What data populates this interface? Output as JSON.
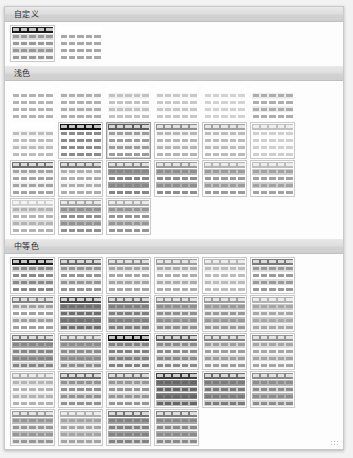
{
  "gallery": {
    "title": "表格样式库",
    "sections": [
      {
        "id": "custom",
        "label": "自定义",
        "columns": 7,
        "thumbs": [
          {
            "name": "custom-style-1",
            "header": "#1c1c1c",
            "band_a": "#d9d9d9",
            "band_b": "#f4f4f4",
            "cell": "#9a9a9a",
            "bordered": true,
            "selected": false
          },
          {
            "name": "custom-style-2",
            "header": "#ffffff",
            "band_a": "#ffffff",
            "band_b": "#ffffff",
            "cell": "#a8a8a8",
            "bordered": false,
            "selected": false
          }
        ]
      },
      {
        "id": "light",
        "label": "浅色",
        "columns": 7,
        "thumbs": [
          {
            "name": "light-1",
            "header": "#ffffff",
            "band_a": "#ffffff",
            "band_b": "#ffffff",
            "cell": "#b4b4b4",
            "bordered": false,
            "selected": false
          },
          {
            "name": "light-2",
            "header": "#ffffff",
            "band_a": "#f6f6f6",
            "band_b": "#ffffff",
            "cell": "#b0b0b0",
            "bordered": false,
            "selected": false
          },
          {
            "name": "light-3",
            "header": "#ffffff",
            "band_a": "#f2f2f2",
            "band_b": "#ffffff",
            "cell": "#c2c2c2",
            "bordered": false,
            "selected": false
          },
          {
            "name": "light-4",
            "header": "#ffffff",
            "band_a": "#f7f7f7",
            "band_b": "#ffffff",
            "cell": "#c8c8c8",
            "bordered": false,
            "selected": false
          },
          {
            "name": "light-5",
            "header": "#ffffff",
            "band_a": "#fafafa",
            "band_b": "#ffffff",
            "cell": "#d2d2d2",
            "bordered": false,
            "selected": false
          },
          {
            "name": "light-6",
            "header": "#ffffff",
            "band_a": "#ededed",
            "band_b": "#ffffff",
            "cell": "#aeaeae",
            "bordered": false,
            "selected": false
          },
          {
            "name": "light-7",
            "header": "#ffffff",
            "band_a": "#f4f4f4",
            "band_b": "#ffffff",
            "cell": "#bdbdbd",
            "bordered": false,
            "selected": false
          },
          {
            "name": "light-8",
            "header": "#141414",
            "band_a": "#ffffff",
            "band_b": "#ffffff",
            "cell": "#8c8c8c",
            "bordered": true,
            "selected": false
          },
          {
            "name": "light-9",
            "header": "#5e5e5e",
            "band_a": "#f0f0f0",
            "band_b": "#ffffff",
            "cell": "#9d9d9d",
            "bordered": true,
            "selected": true
          },
          {
            "name": "light-10",
            "header": "#8f8f8f",
            "band_a": "#f4f4f4",
            "band_b": "#ffffff",
            "cell": "#b6b6b6",
            "bordered": true,
            "selected": false
          },
          {
            "name": "light-11",
            "header": "#a2a2a2",
            "band_a": "#f6f6f6",
            "band_b": "#ffffff",
            "cell": "#bcbcbc",
            "bordered": true,
            "selected": false
          },
          {
            "name": "light-12",
            "header": "#c0c0c0",
            "band_a": "#fafafa",
            "band_b": "#ffffff",
            "cell": "#cfcfcf",
            "bordered": true,
            "selected": false
          },
          {
            "name": "light-13",
            "header": "#6e6e6e",
            "band_a": "#efefef",
            "band_b": "#ffffff",
            "cell": "#a4a4a4",
            "bordered": true,
            "selected": false
          },
          {
            "name": "light-14",
            "header": "#7a7a7a",
            "band_a": "#f2f2f2",
            "band_b": "#ffffff",
            "cell": "#aeaeae",
            "bordered": true,
            "selected": false
          },
          {
            "name": "light-15",
            "header": "#8a8a8a",
            "band_a": "#9e9e9e",
            "band_b": "#ffffff",
            "cell": "#878787",
            "bordered": true,
            "selected": false
          },
          {
            "name": "light-16",
            "header": "#9b9b9b",
            "band_a": "#b2b2b2",
            "band_b": "#ffffff",
            "cell": "#8e8e8e",
            "bordered": true,
            "selected": false
          },
          {
            "name": "light-17",
            "header": "#b4b4b4",
            "band_a": "#c6c6c6",
            "band_b": "#ffffff",
            "cell": "#9c9c9c",
            "bordered": true,
            "selected": false
          },
          {
            "name": "light-18",
            "header": "#bdbdbd",
            "band_a": "#cdcdcd",
            "band_b": "#ffffff",
            "cell": "#a3a3a3",
            "bordered": true,
            "selected": false
          },
          {
            "name": "light-19",
            "header": "#cfcfcf",
            "band_a": "#dcdcdc",
            "band_b": "#ffffff",
            "cell": "#b4b4b4",
            "bordered": true,
            "selected": false
          },
          {
            "name": "light-20",
            "header": "#a5a5a5",
            "band_a": "#b8b8b8",
            "band_b": "#ffffff",
            "cell": "#919191",
            "bordered": true,
            "selected": false
          },
          {
            "name": "light-21",
            "header": "#adadad",
            "band_a": "#c0c0c0",
            "band_b": "#ffffff",
            "cell": "#969696",
            "bordered": true,
            "selected": false
          }
        ]
      },
      {
        "id": "medium",
        "label": "中等色",
        "columns": 7,
        "thumbs": [
          {
            "name": "medium-1",
            "header": "#1a1a1a",
            "band_a": "#d6d6d6",
            "band_b": "#ffffff",
            "cell": "#8a8a8a",
            "bordered": true,
            "selected": false
          },
          {
            "name": "medium-2",
            "header": "#6a6a6a",
            "band_a": "#dcdcdc",
            "band_b": "#ffffff",
            "cell": "#969696",
            "bordered": true,
            "selected": false
          },
          {
            "name": "medium-3",
            "header": "#8d8d8d",
            "band_a": "#e4e4e4",
            "band_b": "#ffffff",
            "cell": "#a6a6a6",
            "bordered": true,
            "selected": false
          },
          {
            "name": "medium-4",
            "header": "#9c9c9c",
            "band_a": "#e8e8e8",
            "band_b": "#ffffff",
            "cell": "#adadad",
            "bordered": true,
            "selected": false
          },
          {
            "name": "medium-5",
            "header": "#b5b5b5",
            "band_a": "#ededed",
            "band_b": "#ffffff",
            "cell": "#bcbcbc",
            "bordered": true,
            "selected": false
          },
          {
            "name": "medium-6",
            "header": "#787878",
            "band_a": "#dedede",
            "band_b": "#ffffff",
            "cell": "#9b9b9b",
            "bordered": true,
            "selected": false
          },
          {
            "name": "medium-7",
            "header": "#828282",
            "band_a": "#e1e1e1",
            "band_b": "#ffffff",
            "cell": "#a1a1a1",
            "bordered": true,
            "selected": false
          },
          {
            "name": "medium-8",
            "header": "#4a4a4a",
            "band_a": "#8c8c8c",
            "band_b": "#c9c9c9",
            "cell": "#6f6f6f",
            "bordered": true,
            "selected": false
          },
          {
            "name": "medium-9",
            "header": "#707070",
            "band_a": "#a2a2a2",
            "band_b": "#d5d5d5",
            "cell": "#7f7f7f",
            "bordered": true,
            "selected": false
          },
          {
            "name": "medium-10",
            "header": "#8f8f8f",
            "band_a": "#b4b4b4",
            "band_b": "#dedede",
            "cell": "#909090",
            "bordered": true,
            "selected": false
          },
          {
            "name": "medium-11",
            "header": "#9c9c9c",
            "band_a": "#bdbdbd",
            "band_b": "#e4e4e4",
            "cell": "#9a9a9a",
            "bordered": true,
            "selected": false
          },
          {
            "name": "medium-12",
            "header": "#b2b2b2",
            "band_a": "#cbcbcb",
            "band_b": "#ebebeb",
            "cell": "#a8a8a8",
            "bordered": true,
            "selected": false
          },
          {
            "name": "medium-13",
            "header": "#7c7c7c",
            "band_a": "#a9a9a9",
            "band_b": "#d8d8d8",
            "cell": "#868686",
            "bordered": true,
            "selected": false
          },
          {
            "name": "medium-14",
            "header": "#878787",
            "band_a": "#afafaf",
            "band_b": "#dbdbdb",
            "cell": "#8d8d8d",
            "bordered": true,
            "selected": false
          },
          {
            "name": "medium-15",
            "header": "#111111",
            "band_a": "#c4c4c4",
            "band_b": "#ededed",
            "cell": "#828282",
            "bordered": true,
            "selected": false
          },
          {
            "name": "medium-16",
            "header": "#5c5c5c",
            "band_a": "#cccccc",
            "band_b": "#f0f0f0",
            "cell": "#8c8c8c",
            "bordered": true,
            "selected": false
          },
          {
            "name": "medium-17",
            "header": "#848484",
            "band_a": "#d6d6d6",
            "band_b": "#f4f4f4",
            "cell": "#9e9e9e",
            "bordered": true,
            "selected": false
          },
          {
            "name": "medium-18",
            "header": "#949494",
            "band_a": "#dcdcdc",
            "band_b": "#f6f6f6",
            "cell": "#a6a6a6",
            "bordered": true,
            "selected": false
          },
          {
            "name": "medium-19",
            "header": "#aeaeae",
            "band_a": "#e4e4e4",
            "band_b": "#f9f9f9",
            "cell": "#b4b4b4",
            "bordered": true,
            "selected": false
          },
          {
            "name": "medium-20",
            "header": "#6c6c6c",
            "band_a": "#d0d0d0",
            "band_b": "#f1f1f1",
            "cell": "#929292",
            "bordered": true,
            "selected": false
          },
          {
            "name": "medium-21",
            "header": "#767676",
            "band_a": "#d3d3d3",
            "band_b": "#f2f2f2",
            "cell": "#979797",
            "bordered": true,
            "selected": false
          },
          {
            "name": "medium-22",
            "header": "#3f3f3f",
            "band_a": "#7e7e7e",
            "band_b": "#bdbdbd",
            "cell": "#666666",
            "bordered": true,
            "selected": false
          },
          {
            "name": "medium-23",
            "header": "#6b6b6b",
            "band_a": "#9b9b9b",
            "band_b": "#cfcfcf",
            "cell": "#7b7b7b",
            "bordered": true,
            "selected": false
          },
          {
            "name": "medium-24",
            "header": "#8c8c8c",
            "band_a": "#b2b2b2",
            "band_b": "#dcdcdc",
            "cell": "#8d8d8d",
            "bordered": true,
            "selected": false
          },
          {
            "name": "medium-25",
            "header": "#9a9a9a",
            "band_a": "#bbbbbb",
            "band_b": "#e2e2e2",
            "cell": "#979797",
            "bordered": true,
            "selected": false
          },
          {
            "name": "medium-26",
            "header": "#b0b0b0",
            "band_a": "#c9c9c9",
            "band_b": "#e9e9e9",
            "cell": "#a5a5a5",
            "bordered": true,
            "selected": false
          },
          {
            "name": "medium-27",
            "header": "#757575",
            "band_a": "#a4a4a4",
            "band_b": "#d4d4d4",
            "cell": "#828282",
            "bordered": true,
            "selected": false
          },
          {
            "name": "medium-28",
            "header": "#808080",
            "band_a": "#aaaaaa",
            "band_b": "#d8d8d8",
            "cell": "#8a8a8a",
            "bordered": true,
            "selected": false
          }
        ]
      },
      {
        "id": "dark",
        "label": "深色",
        "columns": 7,
        "thumbs": [
          {
            "name": "dark-1",
            "header": "#0e0e0e",
            "band_a": "#5a5a5a",
            "band_b": "#8e8e8e",
            "cell": "#3f3f3f",
            "bordered": true,
            "selected": false
          },
          {
            "name": "dark-2",
            "header": "#1a1a1a",
            "band_a": "#676767",
            "band_b": "#989898",
            "cell": "#4a4a4a",
            "bordered": true,
            "selected": false
          },
          {
            "name": "dark-3",
            "header": "#151515",
            "band_a": "#6f6f6f",
            "band_b": "#a2a2a2",
            "cell": "#505050",
            "bordered": true,
            "selected": false
          },
          {
            "name": "dark-4",
            "header": "#121212",
            "band_a": "#636363",
            "band_b": "#959595",
            "cell": "#464646",
            "bordered": true,
            "selected": false
          },
          {
            "name": "dark-5",
            "header": "#191919",
            "band_a": "#6b6b6b",
            "band_b": "#9d9d9d",
            "cell": "#4d4d4d",
            "bordered": true,
            "selected": false
          },
          {
            "name": "dark-6",
            "header": "#101010",
            "band_a": "#5f5f5f",
            "band_b": "#919191",
            "cell": "#434343",
            "bordered": true,
            "selected": false
          },
          {
            "name": "dark-7",
            "header": "#171717",
            "band_a": "#696969",
            "band_b": "#9a9a9a",
            "cell": "#4b4b4b",
            "bordered": true,
            "selected": false
          },
          {
            "name": "dark-8",
            "header": "#0c0c0c",
            "band_a": "#7e7e7e",
            "band_b": "#b4b4b4",
            "cell": "#5c5c5c",
            "bordered": true,
            "selected": false
          },
          {
            "name": "dark-9",
            "header": "#8b8b8b",
            "band_a": "#b6b6b6",
            "band_b": "#e0e0e0",
            "cell": "#9a9a9a",
            "bordered": true,
            "selected": false
          },
          {
            "name": "dark-10",
            "header": "#c2c2c2",
            "band_a": "#d8d8d8",
            "band_b": "#f2f2f2",
            "cell": "#c0c0c0",
            "bordered": true,
            "selected": false
          },
          {
            "name": "dark-11",
            "header": "#7a7a7a",
            "band_a": "#ababab",
            "band_b": "#dadada",
            "cell": "#8f8f8f",
            "bordered": true,
            "selected": false
          },
          {
            "name": "dark-12",
            "header": "#9e9e9e",
            "band_a": "#c3c3c3",
            "band_b": "#e7e7e7",
            "cell": "#a6a6a6",
            "bordered": true,
            "selected": false
          },
          {
            "name": "dark-13",
            "header": "#b0b0b0",
            "band_a": "#cecece",
            "band_b": "#ededed",
            "cell": "#b2b2b2",
            "bordered": true,
            "selected": false
          },
          {
            "name": "dark-14",
            "header": "#868686",
            "band_a": "#b1b1b1",
            "band_b": "#dddddd",
            "cell": "#959595",
            "bordered": true,
            "selected": false
          }
        ]
      }
    ],
    "menu": [
      {
        "name": "new-table-style",
        "icon": "table-icon",
        "label": "新建表格样式(N)..."
      },
      {
        "name": "new-pivot-style",
        "icon": "pivot-table-icon",
        "label": "新建数据透视表样式(P)..."
      }
    ]
  }
}
